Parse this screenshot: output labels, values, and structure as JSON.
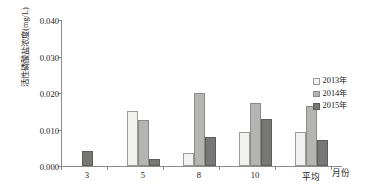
{
  "chart_data": {
    "type": "bar",
    "title": "",
    "xlabel": "月份",
    "ylabel": "活性磷酸盐浓度(mg/L)",
    "categories": [
      "3",
      "5",
      "8",
      "10",
      "平均"
    ],
    "series": [
      {
        "name": "2013年",
        "color": "#f2f1ef",
        "values": [
          null,
          0.015,
          0.0035,
          0.0092,
          0.0092
        ]
      },
      {
        "name": "2014年",
        "color": "#b4b4b2",
        "values": [
          null,
          0.0125,
          0.02,
          0.0172,
          0.0165
        ]
      },
      {
        "name": "2015年",
        "color": "#767674",
        "values": [
          0.0042,
          0.002,
          0.008,
          0.013,
          0.007
        ]
      }
    ],
    "ylim": [
      0.0,
      0.04
    ],
    "ytick_labels": [
      "0.000",
      "0.010",
      "0.020",
      "0.030",
      "0.040"
    ],
    "ytick_values": [
      0.0,
      0.01,
      0.02,
      0.03,
      0.04
    ],
    "grid": false,
    "legend_position": "right"
  },
  "legend": {
    "items": [
      {
        "label": "2013年"
      },
      {
        "label": "2014年"
      },
      {
        "label": "2015年"
      }
    ]
  }
}
